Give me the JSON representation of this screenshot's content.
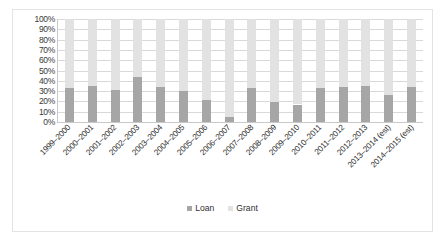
{
  "chart_data": {
    "type": "bar",
    "subtype": "100% stacked column",
    "title": "",
    "xlabel": "",
    "ylabel": "",
    "ylim": [
      0,
      100
    ],
    "y_ticks": [
      "0%",
      "10%",
      "20%",
      "30%",
      "40%",
      "50%",
      "60%",
      "70%",
      "80%",
      "90%",
      "100%"
    ],
    "grid": true,
    "legend_position": "bottom",
    "categories": [
      "1999–2000",
      "2000–2001",
      "2001–2002",
      "2002–2003",
      "2003–2004",
      "2004–2005",
      "2005–2006",
      "2006–2007",
      "2007–2008",
      "2008–2009",
      "2009–2010",
      "2010–2011",
      "2011–2012",
      "2012–2013",
      "2013–2014 (est)",
      "2014–2015 (est)"
    ],
    "series": [
      {
        "name": "Loan",
        "color": "#a6a6a6",
        "values": [
          33,
          35,
          31,
          44,
          34,
          30,
          21,
          5,
          33,
          19,
          17,
          33,
          34,
          35,
          26,
          34
        ]
      },
      {
        "name": "Grant",
        "color": "#e2e2e2",
        "values": [
          67,
          65,
          69,
          56,
          66,
          70,
          79,
          95,
          67,
          81,
          83,
          67,
          66,
          65,
          74,
          66
        ]
      }
    ]
  },
  "legend": {
    "items": [
      {
        "label": "Loan",
        "swatch": "loan"
      },
      {
        "label": "Grant",
        "swatch": "grant"
      }
    ]
  },
  "colors": {
    "loan": "#a6a6a6",
    "grant": "#e2e2e2",
    "gridline": "#d9d9d9",
    "axis": "#c9c9c9",
    "border": "#e3e3e3",
    "text": "#2f2f2f"
  }
}
